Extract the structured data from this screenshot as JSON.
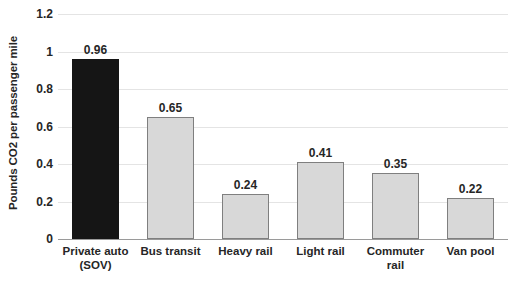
{
  "chart_data": {
    "type": "bar",
    "title": "",
    "subtitle": "",
    "xlabel": "",
    "ylabel": "Pounds CO2 per passenger mile",
    "ylim": [
      0,
      1.2
    ],
    "yticks": [
      "0",
      "0.2",
      "0.4",
      "0.6",
      "0.8",
      "1",
      "1.2"
    ],
    "ytick_values": [
      0,
      0.2,
      0.4,
      0.6,
      0.8,
      1,
      1.2
    ],
    "grid": true,
    "legend": "none",
    "categories": [
      "Private auto (SOV)",
      "Bus transit",
      "Heavy rail",
      "Light rail",
      "Commuter rail",
      "Van pool"
    ],
    "category_lines": [
      [
        "Private auto",
        "(SOV)"
      ],
      [
        "Bus transit"
      ],
      [
        "Heavy rail"
      ],
      [
        "Light rail"
      ],
      [
        "Commuter",
        "rail"
      ],
      [
        "Van pool"
      ]
    ],
    "values": [
      0.96,
      0.65,
      0.24,
      0.41,
      0.35,
      0.22
    ],
    "value_labels": [
      "0.96",
      "0.65",
      "0.24",
      "0.41",
      "0.35",
      "0.22"
    ],
    "highlight_index": 0,
    "colors": {
      "bar_fill": "#d8d8d8",
      "bar_border": "#7f7f7f",
      "highlight_fill": "#151515",
      "gridline": "#e4e4e4",
      "axis_line": "#9a9a9a",
      "text": "#262626",
      "background": "#ffffff"
    }
  }
}
